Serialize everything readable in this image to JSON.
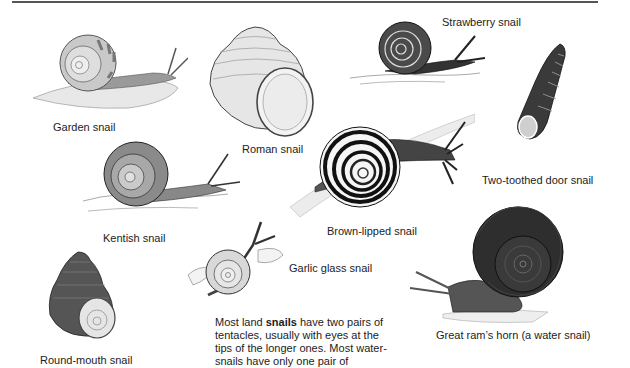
{
  "page": {
    "rule_color": "#555555",
    "snails": [
      {
        "id": "garden",
        "label": "Garden snail"
      },
      {
        "id": "roman",
        "label": "Roman snail"
      },
      {
        "id": "strawberry",
        "label": "Strawberry snail"
      },
      {
        "id": "two-toothed-door",
        "label": "Two-toothed door snail"
      },
      {
        "id": "kentish",
        "label": "Kentish snail"
      },
      {
        "id": "brown-lipped",
        "label": "Brown-lipped snail"
      },
      {
        "id": "garlic-glass",
        "label": "Garlic glass snail"
      },
      {
        "id": "great-rams-horn",
        "label": "Great ram’s horn (a water snail)"
      },
      {
        "id": "round-mouth",
        "label": "Round-mouth snail"
      }
    ],
    "caption": {
      "before_bold": "Most land ",
      "bold": "snails",
      "after_bold": " have two pairs of tentacles, usually with eyes at the tips of the longer ones. Most water-snails have only one pair of"
    }
  }
}
